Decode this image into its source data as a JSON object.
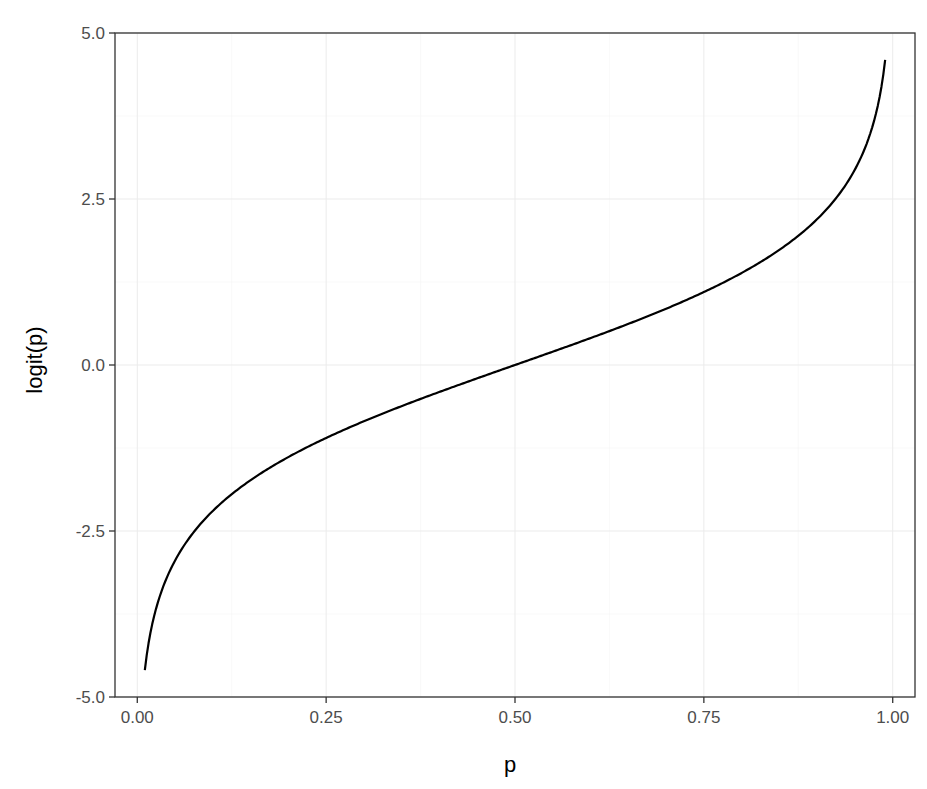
{
  "chart_data": {
    "type": "line",
    "title": "",
    "xlabel": "p",
    "ylabel": "logit(p)",
    "xlim": [
      -0.0295,
      1.0295
    ],
    "ylim": [
      -5.0,
      5.0
    ],
    "x_ticks": [
      0.0,
      0.25,
      0.5,
      0.75,
      1.0
    ],
    "x_tick_labels": [
      "0.00",
      "0.25",
      "0.50",
      "0.75",
      "1.00"
    ],
    "y_ticks": [
      -5.0,
      -2.5,
      0.0,
      2.5,
      5.0
    ],
    "y_tick_labels": [
      "-5.0",
      "-2.5",
      "0.0",
      "2.5",
      "5.0"
    ],
    "grid": true,
    "legend": "none",
    "series": [
      {
        "name": "logit(p)",
        "color": "#000000",
        "function": "log(p/(1-p))",
        "x": [
          0.01,
          0.02,
          0.03,
          0.05,
          0.075,
          0.1,
          0.15,
          0.2,
          0.25,
          0.3,
          0.35,
          0.4,
          0.45,
          0.5,
          0.55,
          0.6,
          0.65,
          0.7,
          0.75,
          0.8,
          0.85,
          0.9,
          0.925,
          0.95,
          0.97,
          0.98,
          0.99
        ],
        "values": [
          -4.595,
          -3.892,
          -3.476,
          -2.944,
          -2.512,
          -2.197,
          -1.735,
          -1.386,
          -1.099,
          -0.847,
          -0.619,
          -0.405,
          -0.201,
          0.0,
          0.201,
          0.405,
          0.619,
          0.847,
          1.099,
          1.386,
          1.735,
          2.197,
          2.512,
          2.944,
          3.476,
          3.892,
          4.595
        ]
      }
    ]
  },
  "style": {
    "panel_background": "#ffffff",
    "panel_border": "#333333",
    "grid_major": "#ebebeb",
    "grid_minor": "#f5f5f5",
    "tick_label_color": "#4d4d4d",
    "line_color": "#000000"
  }
}
